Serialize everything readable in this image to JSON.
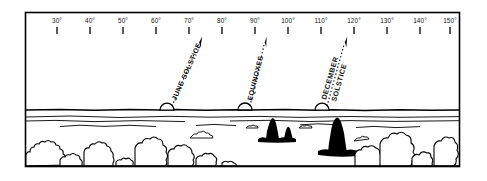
{
  "figure": {
    "type": "horizon-azimuth-diagram",
    "background_color": "#ffffff",
    "ink_color": "#000000",
    "frame": {
      "x": 25,
      "y": 12,
      "width": 435,
      "height": 155
    }
  },
  "scale": {
    "name": "azimuth-degree-scale",
    "unit": "degrees",
    "min": 30,
    "max": 150,
    "step": 10,
    "suffix": "°",
    "ticks": [
      {
        "value": 30,
        "label": "30°",
        "x": 57
      },
      {
        "value": 40,
        "label": "40°",
        "x": 90
      },
      {
        "value": 50,
        "label": "50°",
        "x": 123
      },
      {
        "value": 60,
        "label": "60°",
        "x": 156
      },
      {
        "value": 70,
        "label": "70°",
        "x": 189
      },
      {
        "value": 80,
        "label": "80°",
        "x": 222
      },
      {
        "value": 90,
        "label": "90°",
        "x": 255
      },
      {
        "value": 100,
        "label": "100°",
        "x": 288
      },
      {
        "value": 110,
        "label": "110°",
        "x": 321
      },
      {
        "value": 120,
        "label": "120°",
        "x": 354
      },
      {
        "value": 130,
        "label": "130°",
        "x": 387
      },
      {
        "value": 140,
        "label": "140°",
        "x": 420
      },
      {
        "value": 150,
        "label": "150°",
        "x": 450
      }
    ]
  },
  "events": [
    {
      "id": "june-solstice",
      "label_lines": [
        "JUNE SOLSTICE"
      ],
      "label": "JUNE SOLSTICE",
      "azimuth_degrees": 65,
      "sun": {
        "x": 167,
        "y": 111,
        "radius": 7
      },
      "arrow": {
        "x1": 172,
        "y1": 107,
        "x2": 201,
        "y2": 39
      }
    },
    {
      "id": "equinoxes",
      "label_lines": [
        "EQUINOXES"
      ],
      "label": "EQUINOXES",
      "azimuth_degrees": 90,
      "sun": {
        "x": 245,
        "y": 111,
        "radius": 7
      },
      "arrow": {
        "x1": 250,
        "y1": 107,
        "x2": 266,
        "y2": 39
      }
    },
    {
      "id": "december-solstice",
      "label_lines": [
        "DECEMBER",
        "SOLSTICE"
      ],
      "label": "DECEMBER SOLSTICE",
      "azimuth_degrees": 115,
      "sun": {
        "x": 322,
        "y": 111,
        "radius": 7
      },
      "arrow": {
        "x1": 327,
        "y1": 107,
        "x2": 345,
        "y2": 39
      }
    }
  ],
  "scenery": {
    "horizon_label": "horizon-line",
    "water_label": "water-surface",
    "silhouettes": [
      {
        "id": "dark-tree-center-large",
        "x": 272
      },
      {
        "id": "dark-tree-center-small",
        "x": 288
      },
      {
        "id": "dark-tree-right-large",
        "x": 338
      }
    ],
    "foreground_label": "foreground-vegetation"
  }
}
